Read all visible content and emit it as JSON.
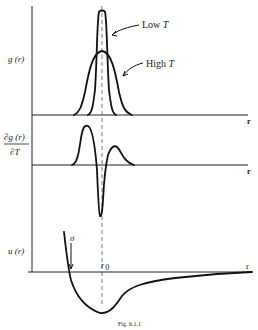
{
  "figure": {
    "caption": "Fig. 6.1.1",
    "panels": [
      {
        "id": "pair-distribution",
        "ylabel": "g (r)",
        "xlabel": "r",
        "annotations": [
          {
            "text": "Low",
            "italic_suffix": "T"
          },
          {
            "text": "High",
            "italic_suffix": "T"
          }
        ]
      },
      {
        "id": "temperature-derivative",
        "ylabel_numerator": "∂g (r)",
        "ylabel_denominator": "∂T",
        "xlabel": "r"
      },
      {
        "id": "pair-potential",
        "ylabel": "u (r)",
        "xlabel": "r",
        "annotations": [
          {
            "text": "σ"
          },
          {
            "text": "r",
            "subscript": "0"
          }
        ]
      }
    ]
  },
  "colors": {
    "ink": "#111111",
    "background": "#ffffff",
    "dashed_line": "#555555"
  }
}
